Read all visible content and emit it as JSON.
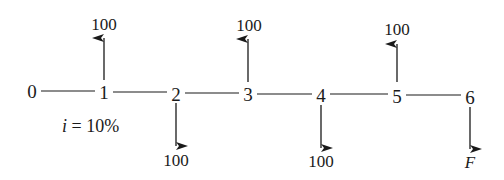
{
  "diagram": {
    "type": "cash-flow-timeline",
    "periods": [
      {
        "label": "0",
        "x": 32
      },
      {
        "label": "1",
        "x": 104
      },
      {
        "label": "2",
        "x": 176
      },
      {
        "label": "3",
        "x": 248
      },
      {
        "label": "4",
        "x": 321
      },
      {
        "label": "5",
        "x": 397
      },
      {
        "label": "6",
        "x": 470
      }
    ],
    "cash_flows": [
      {
        "period": "1",
        "direction": "up",
        "amount": "100"
      },
      {
        "period": "2",
        "direction": "down",
        "amount": "100"
      },
      {
        "period": "3",
        "direction": "up",
        "amount": "100"
      },
      {
        "period": "4",
        "direction": "down",
        "amount": "100"
      },
      {
        "period": "5",
        "direction": "up",
        "amount": "100"
      },
      {
        "period": "6",
        "direction": "down",
        "amount": "F"
      }
    ],
    "interest_rate": {
      "symbol": "i",
      "text": " = 10%"
    },
    "line_color": "#1a1a1a"
  }
}
